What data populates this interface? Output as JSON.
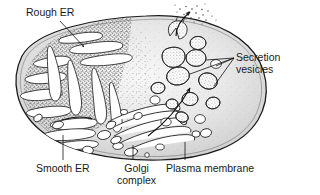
{
  "figure": {
    "style": "black and white line drawing with stippling"
  },
  "labels": {
    "rough_er": "Rough ER",
    "secretion_vesicles": "Secretion\nvesicles",
    "smooth_er": "Smooth ER",
    "golgi_complex": "Golgi\ncomplex",
    "plasma_membrane": "Plasma membrane"
  },
  "colors": {
    "background": "#ffffff",
    "cytoplasm_light": "#f3f3f3",
    "cytoplasm_mid": "#dcdcdc",
    "cytoplasm_edge": "#c9c9c9",
    "stipple": "#4a4a4a",
    "outline": "#1a1a1a",
    "organelle_fill": "#ffffff",
    "text": "#1a1a1a"
  },
  "structures": {
    "cell_outline": "large oval spanning most of the frame",
    "rough_er_region": "dense stippled zone in upper-left quadrant with elongated white cisternae",
    "smooth_er_region": "smooth white tubules in lower-left quadrant",
    "golgi_region": "stack of curved flattened sacs in lower-center",
    "vesicle_region": "round stippled vesicles in right half",
    "exocytosis_site": "vesicle fusing with membrane at top releasing particles outward"
  },
  "arrows": {
    "smooth_to_golgi": "short arrow pointing right from smooth ER toward Golgi",
    "golgi_to_membrane": "long curved arrow pointing up-right from Golgi to plasma membrane",
    "exocytosis": "curved arrow through fusing vesicle pointing out of the cell",
    "rough_er_leader_arrow": "leader line from Rough ER label ending in arrowhead"
  }
}
